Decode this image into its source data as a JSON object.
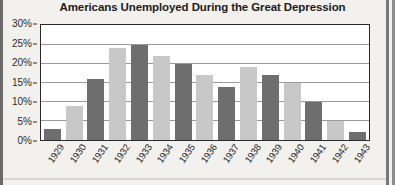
{
  "chart_data": {
    "type": "bar",
    "title": "Americans Unemployed During the Great Depression",
    "xlabel": "",
    "ylabel": "",
    "ylim": [
      0,
      30
    ],
    "ytick_labels": [
      "30%",
      "25%",
      "20%",
      "15%",
      "10%",
      "5%",
      "0%"
    ],
    "ytick_values": [
      30,
      25,
      20,
      15,
      10,
      5,
      0
    ],
    "grid": true,
    "legend": "none",
    "categories": [
      "1929",
      "1930",
      "1931",
      "1932",
      "1933",
      "1934",
      "1935",
      "1936",
      "1937",
      "1938",
      "1939",
      "1940",
      "1941",
      "1942",
      "1943"
    ],
    "values": [
      3,
      9,
      16,
      24,
      25,
      22,
      20,
      17,
      14,
      19,
      17,
      15,
      10,
      5,
      2
    ],
    "bar_colors": [
      "#6e6e6e",
      "#c8c8c8",
      "#6e6e6e",
      "#c8c8c8",
      "#6e6e6e",
      "#c8c8c8",
      "#6e6e6e",
      "#c8c8c8",
      "#6e6e6e",
      "#c8c8c8",
      "#6e6e6e",
      "#c8c8c8",
      "#6e6e6e",
      "#c8c8c8",
      "#6e6e6e"
    ],
    "colors": {
      "bar_dark": "#6e6e6e",
      "bar_light": "#c8c8c8",
      "plot_background": "#ffffff",
      "page_background": "#f2f1ee",
      "frame": "#2a2a2a",
      "gridline": "#9a9a9a",
      "text": "#1c1c1c"
    }
  }
}
